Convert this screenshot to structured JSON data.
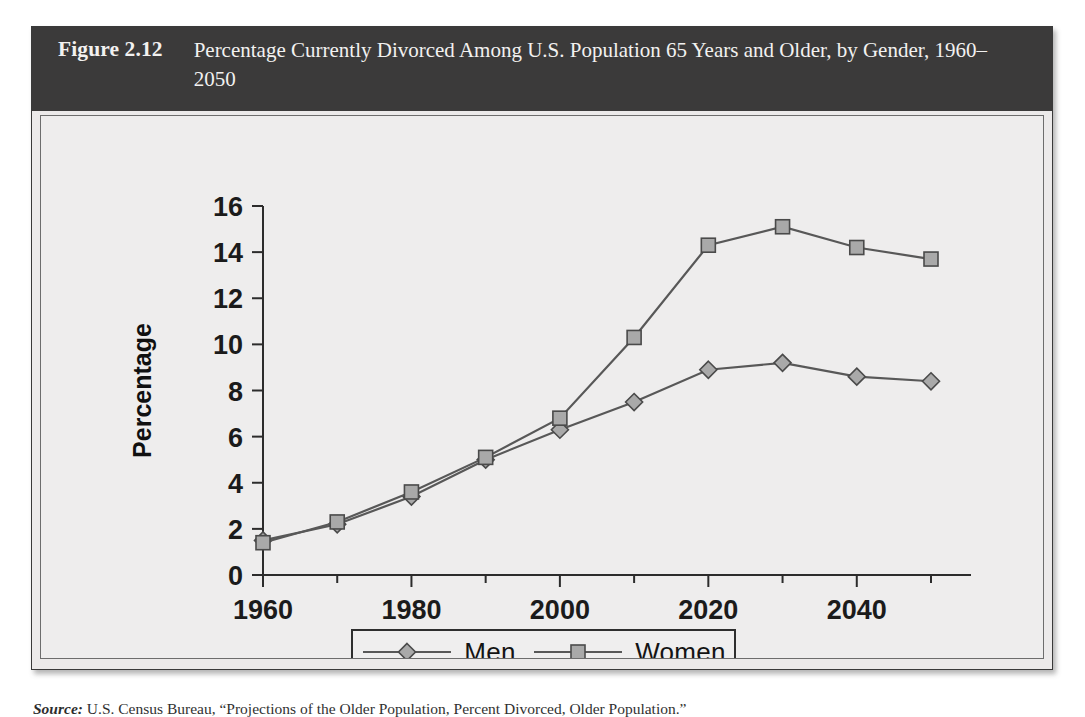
{
  "figure": {
    "label": "Figure 2.12",
    "title": "Percentage Currently Divorced Among U.S. Population 65 Years and Older, by Gender, 1960–2050"
  },
  "colors": {
    "header_bg": "#3b3a3a",
    "header_text": "#f2f1f0",
    "panel_bg": "#eeeded",
    "panel_border": "#6d6d6d",
    "axis": "#2c2c2c",
    "line": "#585858",
    "marker_fill": "#a9a9a9",
    "marker_stroke": "#4a4a4a"
  },
  "legend": {
    "position": "bottom-center",
    "entries": [
      {
        "label": "Men",
        "marker": "diamond-marker"
      },
      {
        "label": "Women",
        "marker": "square-marker"
      }
    ]
  },
  "source_caption": {
    "label": "Source:",
    "text": "U.S. Census Bureau, “Projections of the Older Population, Percent Divorced, Older Population.”"
  },
  "chart_data": {
    "type": "line",
    "title": "Percentage Currently Divorced Among U.S. Population 65 Years and Older, by Gender, 1960–2050",
    "xlabel": "",
    "ylabel": "Percentage",
    "x": [
      1960,
      1970,
      1980,
      1990,
      2000,
      2010,
      2020,
      2030,
      2040,
      2050
    ],
    "xlim": [
      1960,
      2050
    ],
    "ylim": [
      0,
      16
    ],
    "yticks": [
      0,
      2,
      4,
      6,
      8,
      10,
      12,
      14,
      16
    ],
    "ytick_labels": [
      "0",
      "2",
      "4",
      "6",
      "8",
      "10",
      "12",
      "14",
      "16"
    ],
    "xticks": [
      1960,
      1980,
      2000,
      2020,
      2040
    ],
    "xtick_labels": [
      "1960",
      "1980",
      "2000",
      "2020",
      "2040"
    ],
    "x_minor_ticks": [
      1970,
      1990,
      2010,
      2030,
      2050
    ],
    "grid": false,
    "legend_position": "bottom-center",
    "series": [
      {
        "name": "Men",
        "marker": "diamond",
        "values": [
          1.5,
          2.2,
          3.4,
          5.0,
          6.3,
          7.5,
          8.9,
          9.2,
          8.6,
          8.4
        ]
      },
      {
        "name": "Women",
        "marker": "square",
        "values": [
          1.4,
          2.3,
          3.6,
          5.1,
          6.8,
          10.3,
          14.3,
          15.1,
          14.2,
          13.7
        ]
      }
    ]
  }
}
